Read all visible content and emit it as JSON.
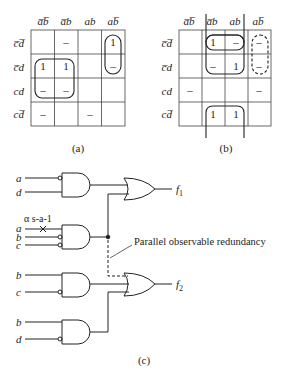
{
  "kmap_a": {
    "caption": "(a)",
    "col_headers": [
      "a̅b̅",
      "a̅b",
      "ab",
      "ab̅"
    ],
    "row_headers": [
      "c̅d̅",
      "c̅d",
      "cd",
      "cd̅"
    ],
    "cells": [
      [
        "",
        "–",
        "",
        "1"
      ],
      [
        "1",
        "1",
        "",
        "–"
      ],
      [
        "–",
        "–",
        "",
        ""
      ],
      [
        "–",
        "",
        "–",
        ""
      ]
    ],
    "groups": [
      "rows 2-3 cols 1-2 solid",
      "rows 1-2 col 4 solid"
    ]
  },
  "kmap_b": {
    "caption": "(b)",
    "col_headers": [
      "a̅b̅",
      "a̅b",
      "ab",
      "ab̅"
    ],
    "row_headers": [
      "c̅d̅",
      "c̅d",
      "cd",
      "cd̅"
    ],
    "cells": [
      [
        "",
        "1",
        "–",
        "–"
      ],
      [
        "",
        "–",
        "1",
        "–"
      ],
      [
        "–",
        "",
        "",
        "–"
      ],
      [
        "",
        "1",
        "1",
        ""
      ]
    ],
    "groups": [
      "rows 1-2 cols 2-3 solid",
      "rows 1-2 col 4 dashed",
      "rows 4 cols 2-3 wraparound solid"
    ]
  },
  "circuit": {
    "caption": "(c)",
    "gate1_inputs": [
      "a",
      "d"
    ],
    "gate2_inputs": [
      "a",
      "b",
      "c"
    ],
    "gate3_inputs": [
      "b",
      "c"
    ],
    "gate4_inputs": [
      "b",
      "d"
    ],
    "fault_label": "α s-a-1",
    "outputs": [
      "f1",
      "f2"
    ],
    "annotation": "Parallel observable redundancy"
  }
}
